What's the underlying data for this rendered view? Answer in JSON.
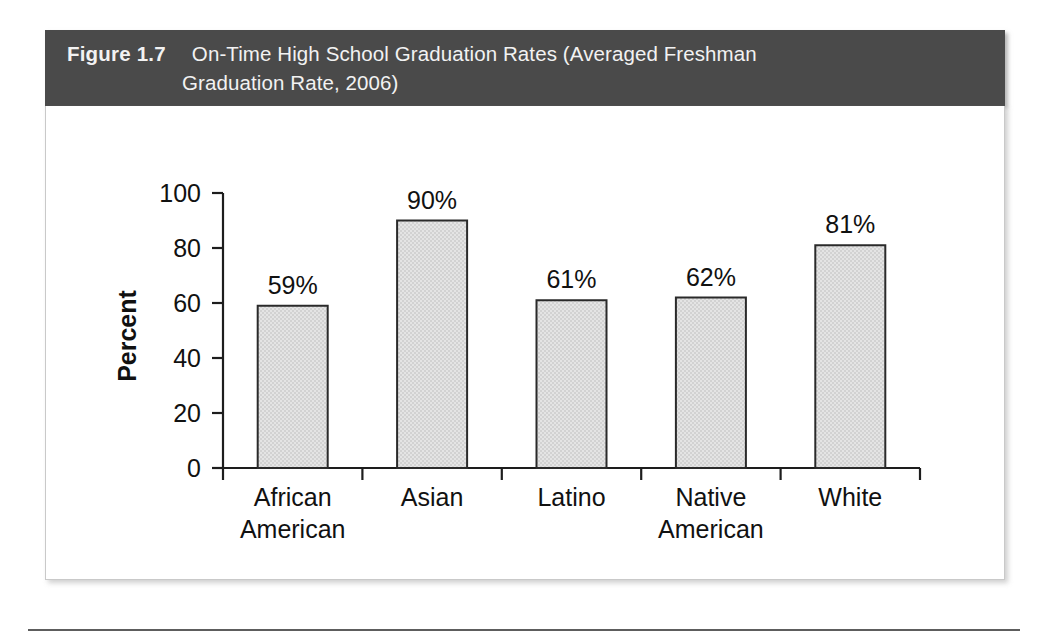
{
  "figure": {
    "number_label": "Figure 1.7",
    "caption_line1": "On-Time High School Graduation Rates (Averaged Freshman",
    "caption_line2": "Graduation Rate, 2006)",
    "header_color": "#4a4a4a",
    "header_text_color": "#f2f2f2",
    "panel_background": "#ffffff"
  },
  "chart_data": {
    "type": "bar",
    "title": "On-Time High School Graduation Rates (Averaged Freshman Graduation Rate, 2006)",
    "categories": [
      "African American",
      "Asian",
      "Latino",
      "Native American",
      "White"
    ],
    "category_lines": [
      [
        "African",
        "American"
      ],
      [
        "Asian",
        ""
      ],
      [
        "Latino",
        ""
      ],
      [
        "Native",
        "American"
      ],
      [
        "White",
        ""
      ]
    ],
    "values": [
      59,
      90,
      61,
      62,
      81
    ],
    "value_labels": [
      "59%",
      "90%",
      "61%",
      "62%",
      "81%"
    ],
    "xlabel": "",
    "ylabel": "Percent",
    "ylim": [
      0,
      100
    ],
    "yticks": [
      0,
      20,
      40,
      60,
      80,
      100
    ],
    "ytick_labels": [
      "0",
      "20",
      "40",
      "60",
      "80",
      "100"
    ],
    "grid": false,
    "legend": false,
    "bar_fill_color": "#d2d2d2",
    "bar_edge_color": "#2a2a2a",
    "axis_color": "#1d1d1d"
  }
}
